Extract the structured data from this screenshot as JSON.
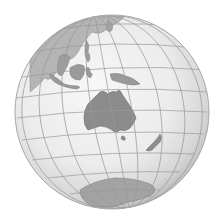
{
  "map": {
    "type": "orthographic-globe",
    "center_view": "Australia / Oceania",
    "colors": {
      "background": "#ffffff",
      "ocean_light": "#f4f4f4",
      "ocean_mid": "#e3e3e3",
      "ocean_edge": "#bdbdbd",
      "land": "#8c8c8c",
      "land_stroke": "#6f6f6f",
      "graticule": "#9a9a9a",
      "outline": "#a8a8a8"
    },
    "regions": [
      {
        "name": "Australia"
      },
      {
        "name": "New Zealand"
      },
      {
        "name": "Antarctica"
      },
      {
        "name": "Southeast Asia"
      },
      {
        "name": "New Guinea"
      },
      {
        "name": "Tasmania"
      }
    ]
  }
}
